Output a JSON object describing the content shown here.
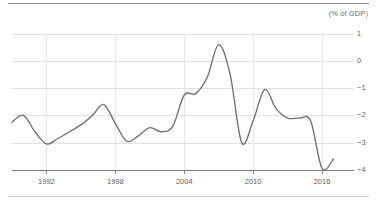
{
  "figure": {
    "unit_label": "(% of GDP)",
    "line_color": "#6e6e6e",
    "grid_color": "#e2e2e2",
    "axis_color": "#7a7a7a",
    "text_color": "#5f5f5f",
    "background": "#ffffff"
  },
  "chart_data": {
    "type": "line",
    "title": "",
    "subtitle": "",
    "xlabel": "",
    "ylabel": "(% of GDP)",
    "unit": "% of GDP",
    "grid": true,
    "legend": false,
    "legend_position": "none",
    "xlim": [
      1989,
      2018
    ],
    "ylim": [
      -4,
      1
    ],
    "xticks": [
      1992,
      1998,
      2004,
      2010,
      2016
    ],
    "xtick_labels": [
      "1992",
      "1998",
      "2004",
      "2010",
      "2016"
    ],
    "yticks": [
      1,
      0,
      -1,
      -2,
      -3,
      -4
    ],
    "ytick_labels": [
      "1",
      "0",
      "−1",
      "−2",
      "−3",
      "−4"
    ],
    "series": [
      {
        "name": "Balance",
        "x": [
          1989,
          1990,
          1991,
          1992,
          1993,
          1994,
          1995,
          1996,
          1997,
          1998,
          1999,
          2000,
          2001,
          2002,
          2003,
          2004,
          2005,
          2006,
          2007,
          2008,
          2009,
          2010,
          2011,
          2012,
          2013,
          2014,
          2015,
          2016,
          2017
        ],
        "values": [
          -2.25,
          -2.0,
          -2.6,
          -3.05,
          -2.85,
          -2.6,
          -2.35,
          -2.0,
          -1.6,
          -2.3,
          -2.95,
          -2.75,
          -2.45,
          -2.6,
          -2.4,
          -1.25,
          -1.2,
          -0.6,
          0.6,
          -0.5,
          -3.0,
          -2.2,
          -1.05,
          -1.75,
          -2.1,
          -2.1,
          -2.2,
          -3.95,
          -3.6
        ]
      }
    ],
    "annotations": [
      {
        "label": "peak",
        "x": 2007,
        "y": 0.6
      },
      {
        "label": "trough",
        "x": 2009,
        "y": -3.0
      },
      {
        "label": "low",
        "x": 2016,
        "y": -3.95
      }
    ]
  }
}
